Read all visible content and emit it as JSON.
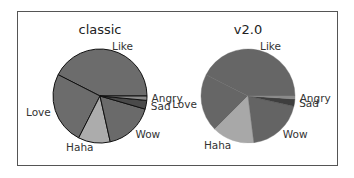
{
  "chart_data": [
    {
      "type": "pie",
      "title": "classic",
      "start_angle": 0,
      "direction": "counterclockwise",
      "categories": [
        "Like",
        "Love",
        "Haha",
        "Wow",
        "Sad",
        "Angry"
      ],
      "values": [
        42.5,
        25,
        11,
        17,
        3,
        1.5
      ],
      "colors": [
        "#6c6c6c",
        "#6c6c6c",
        "#acacac",
        "#6a6a6a",
        "#4a4a4a",
        "#8a8a8a"
      ],
      "wedge_edges": true
    },
    {
      "type": "pie",
      "title": "v2.0",
      "start_angle": 0,
      "direction": "counterclockwise",
      "categories": [
        "Like",
        "Love",
        "Haha",
        "Wow",
        "Sad",
        "Angry"
      ],
      "values": [
        42.5,
        20,
        14.5,
        19.5,
        2.5,
        1
      ],
      "colors": [
        "#666666",
        "#666666",
        "#a8a8a8",
        "#646464",
        "#3e3e3e",
        "#8a8a8a"
      ],
      "wedge_edges": false
    }
  ],
  "labels": {
    "classic_title": "classic",
    "v2_title": "v2.0"
  }
}
